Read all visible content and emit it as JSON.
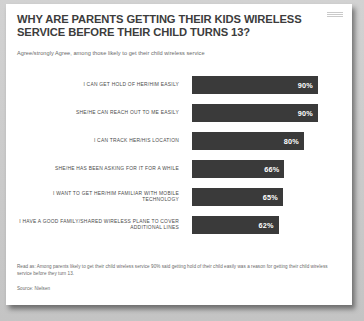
{
  "card": {
    "logo_name": "nielsen-logo"
  },
  "header": {
    "title": "WHY ARE PARENTS GETTING THEIR KIDS WIRELESS SERVICE BEFORE THEIR CHILD TURNS 13?",
    "subtitle": "Agree/strongly Agree, among those likely to get their child wireless service"
  },
  "footer": {
    "read_as": "Read as: Among parents likely to get their child wireless service 90% said getting hold of their child easily was a reason for getting their child wireless service before they turn 13.",
    "source": "Source: Nielsen"
  },
  "colors": {
    "bar": "#3a3a3a",
    "bar_value_text": "#ffffff",
    "card_background": "#ffffff",
    "page_background": "#c9c9c9",
    "title_text": "#3c3c3c",
    "label_text": "#4a4a4a",
    "footnote_text": "#6a6a6a"
  },
  "chart_data": {
    "type": "bar",
    "orientation": "horizontal",
    "title": "WHY ARE PARENTS GETTING THEIR KIDS WIRELESS SERVICE BEFORE THEIR CHILD TURNS 13?",
    "subtitle": "Agree/strongly Agree, among those likely to get their child wireless service",
    "xlabel": "",
    "ylabel": "",
    "xlim": [
      0,
      100
    ],
    "grid": false,
    "legend": false,
    "categories": [
      "I CAN GET HOLD OF HER/HIM EASILY",
      "SHE/HE CAN REACH OUT TO ME EASILY",
      "I CAN TRACK HER/HIS LOCATION",
      "SHE/HE HAS BEEN ASKING FOR IT FOR A WHILE",
      "I WANT TO GET HER/HIM FAMILIAR WITH MOBILE TECHNOLOGY",
      "I HAVE A GOOD FAMILY/SHARED WIRELESS PLANE TO COVER ADDITIONAL LINES"
    ],
    "values": [
      90,
      90,
      80,
      66,
      65,
      62
    ],
    "value_labels": [
      "90%",
      "90%",
      "80%",
      "66%",
      "65%",
      "62%"
    ]
  }
}
